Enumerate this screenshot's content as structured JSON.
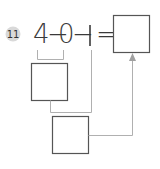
{
  "problem": {
    "number": "11",
    "expression": {
      "a": "4",
      "op1": "−",
      "b": "0",
      "op2": "−",
      "c": "1",
      "eq": "="
    }
  },
  "boxes": {
    "intermediate": "",
    "second": "",
    "answer": ""
  },
  "colors": {
    "badge": "#d9d9d9",
    "text": "#3a3a3a",
    "box_border": "#555555",
    "connector": "#b0b0b0"
  }
}
